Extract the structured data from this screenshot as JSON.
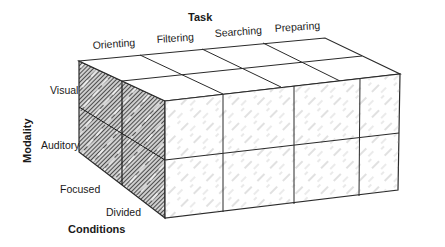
{
  "diagram": {
    "type": "3d-grid-cube",
    "axes": {
      "task": {
        "title": "Task",
        "levels": [
          "Orienting",
          "Filtering",
          "Searching",
          "Preparing"
        ]
      },
      "modality": {
        "title": "Modality",
        "levels": [
          "Visual",
          "Auditory"
        ]
      },
      "conditions": {
        "title": "Conditions",
        "levels": [
          "Focused",
          "Divided"
        ]
      }
    },
    "grid": {
      "columns": 4,
      "rows": 2,
      "depth": 2
    },
    "colors": {
      "line": "#2a2a2a",
      "shaded_face": "#555555",
      "background": "#ffffff"
    }
  }
}
